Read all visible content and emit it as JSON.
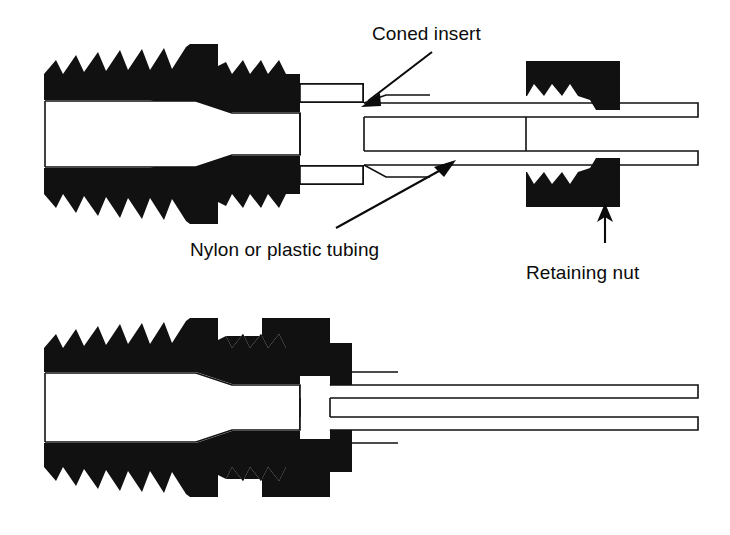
{
  "figure": {
    "colors": {
      "metal": "#111111",
      "bore": "#ffffff",
      "background": "#ffffff",
      "text": "#0b0b0b"
    },
    "views": [
      {
        "id": "exploded",
        "caption": "Upper view — nut and coned tube not yet engaged"
      },
      {
        "id": "assembled",
        "caption": "Lower view — nut tightened onto fitting body"
      }
    ]
  },
  "annotations": {
    "coned_insert": {
      "label": "Coned insert",
      "text_x": 372,
      "text_y": 40,
      "leader": {
        "x1": 432,
        "y1": 52,
        "x2": 364,
        "y2": 105
      },
      "arrow_angle_deg": 218
    },
    "tubing": {
      "label": "Nylon or plastic tubing",
      "text_x": 190,
      "text_y": 256,
      "leader": {
        "x1": 336,
        "y1": 228,
        "x2": 452,
        "y2": 163
      },
      "arrow_angle_deg": 331
    },
    "retaining_nut": {
      "label": "Retaining nut",
      "text_x": 526,
      "text_y": 279,
      "leader": {
        "x1": 605,
        "y1": 243,
        "x2": 605,
        "y2": 206
      },
      "arrow_angle_deg": 270
    }
  },
  "parts": {
    "fitting_body": {
      "name": "Male threaded fitting body",
      "thread_teeth_large": 7,
      "thread_teeth_small": 4
    },
    "retaining_nut": {
      "name": "Retaining nut",
      "thread_teeth": 4
    },
    "tube": {
      "name": "Nylon or plastic tubing",
      "has_coned_end": true
    }
  }
}
